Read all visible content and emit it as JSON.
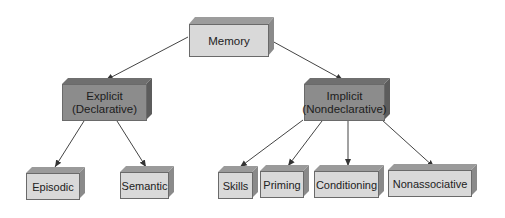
{
  "diagram": {
    "colors": {
      "light_front": "#d9d9d9",
      "light_top": "#9a9a9a",
      "light_side": "#8a8a8a",
      "dark_front": "#8c8c8c",
      "dark_top": "#6e6e6e",
      "dark_side": "#5e5e5e",
      "line": "#333333"
    },
    "nodes": {
      "memory": {
        "label": "Memory"
      },
      "explicit": {
        "label_line1": "Explicit",
        "label_line2": "(Declarative)"
      },
      "implicit": {
        "label_line1": "Implicit",
        "label_line2": "(Nondeclarative)"
      },
      "episodic": {
        "label": "Episodic"
      },
      "semantic": {
        "label": "Semantic"
      },
      "skills": {
        "label": "Skills"
      },
      "priming": {
        "label": "Priming"
      },
      "conditioning": {
        "label": "Conditioning"
      },
      "nonassociative": {
        "label": "Nonassociative"
      }
    },
    "edges": [
      {
        "from": "memory",
        "to": "explicit"
      },
      {
        "from": "memory",
        "to": "implicit"
      },
      {
        "from": "explicit",
        "to": "episodic"
      },
      {
        "from": "explicit",
        "to": "semantic"
      },
      {
        "from": "implicit",
        "to": "skills"
      },
      {
        "from": "implicit",
        "to": "priming"
      },
      {
        "from": "implicit",
        "to": "conditioning"
      },
      {
        "from": "implicit",
        "to": "nonassociative"
      }
    ]
  }
}
